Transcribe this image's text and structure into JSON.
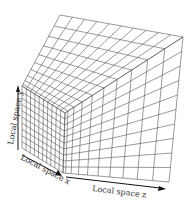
{
  "diagram": {
    "labels": {
      "y": "Local space y",
      "x": "Local space x",
      "z": "Local space z"
    },
    "colors": {
      "grid": "#555555",
      "arrow": "#111111",
      "text": "#333333"
    },
    "vertices": {
      "top_back": [
        60,
        15
      ],
      "top_right": [
        183,
        37
      ],
      "top_left": [
        22,
        86
      ],
      "front_top": [
        65,
        113
      ],
      "front_bottom": [
        63,
        173
      ],
      "left_bottom": [
        22,
        148
      ],
      "right_bottom": [
        169,
        182
      ]
    },
    "grid": {
      "x_divisions": 10,
      "y_divisions": 10,
      "z_divisions": 10
    }
  }
}
